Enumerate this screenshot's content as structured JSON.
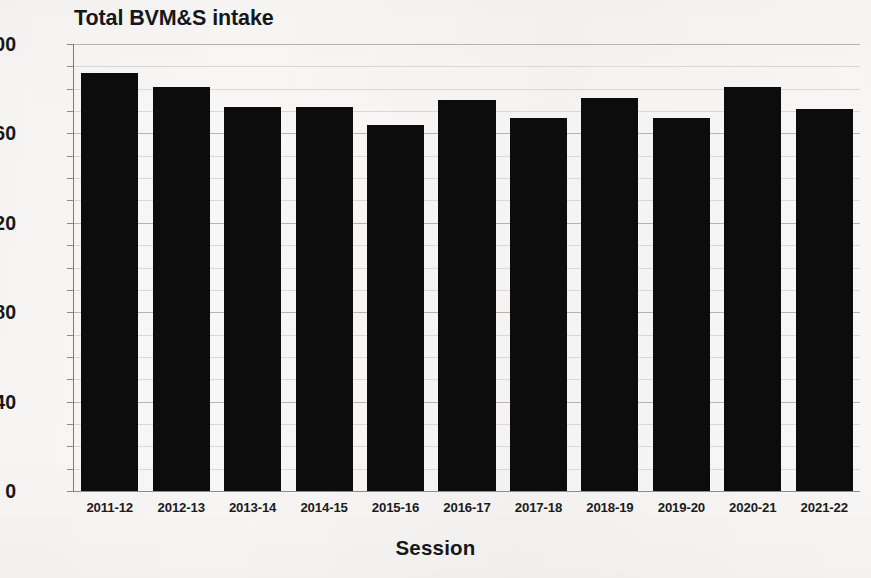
{
  "chart_data": {
    "type": "bar",
    "title": "Total BVM&S intake",
    "xlabel": "Session",
    "ylabel": "",
    "categories": [
      "2011-12",
      "2012-13",
      "2013-14",
      "2014-15",
      "2015-16",
      "2016-17",
      "2017-18",
      "2018-19",
      "2019-20",
      "2020-21",
      "2021-22"
    ],
    "values": [
      187,
      181,
      172,
      172,
      164,
      175,
      167,
      176,
      167,
      181,
      171
    ],
    "ylim": [
      0,
      200
    ],
    "y_ticks": [
      0,
      40,
      80,
      120,
      160,
      200
    ],
    "y_tick_labels": [
      "0",
      "40",
      "80",
      "120",
      "160",
      "200"
    ],
    "minor_tick_step": 10,
    "grid": true,
    "grid_axis": "y",
    "legend": null,
    "bar_color": "#0c0c0c",
    "background_color": "#f8f7f5",
    "gridline_color": "#b9b9b5",
    "text_color": "#17171a"
  }
}
